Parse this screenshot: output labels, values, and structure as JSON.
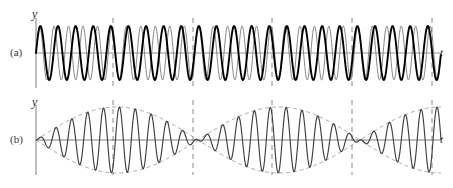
{
  "figure": {
    "width": 453,
    "height": 188,
    "background": "#ffffff"
  },
  "panels": [
    {
      "id": "a",
      "tag": "(a)",
      "y_axis_label": "y",
      "t_axis_label": "t",
      "axis_y_px": 53,
      "axis_x_px": 36,
      "description": "two superimposed sinusoids of slightly different frequency"
    },
    {
      "id": "b",
      "tag": "(b)",
      "y_axis_label": "y",
      "t_axis_label": "t",
      "axis_y_px": 140,
      "axis_x_px": 36,
      "description": "sum of the two sinusoids showing beats with dashed envelope"
    }
  ],
  "colors": {
    "wave_thick": "#000000",
    "wave_thin": "#7a7a7a",
    "sum_wave": "#444444",
    "envelope": "#9a9a9a",
    "axis": "#8a8a8a",
    "node_line": "#8a8a8a",
    "text": "#2b2b2b"
  },
  "chart_data": {
    "type": "line",
    "title": "",
    "xlabel": "t",
    "ylabel": "y",
    "grid": false,
    "legend": "none",
    "xlim": [
      0,
      453
    ],
    "panel_a": {
      "xlabel": "t",
      "ylabel": "y",
      "ylim": [
        -1,
        1
      ],
      "series": [
        {
          "name": "wave-1",
          "style": "thick-black",
          "amplitude": 1,
          "cycles_across_axis": 23,
          "phase_deg": 0
        },
        {
          "name": "wave-2",
          "style": "thin-gray",
          "amplitude": 1,
          "cycles_across_axis": 28,
          "phase_deg": 0
        }
      ]
    },
    "panel_b": {
      "xlabel": "t",
      "ylabel": "y",
      "ylim": [
        -2,
        2
      ],
      "series": [
        {
          "name": "beat-sum",
          "style": "solid-dark",
          "carrier_cycles_across_axis": 25.5,
          "envelope_cycles_across_axis": 2.5,
          "amplitude": 2
        },
        {
          "name": "envelope-upper",
          "style": "dashed-gray",
          "amplitude": 2
        },
        {
          "name": "envelope-lower",
          "style": "dashed-gray",
          "amplitude": -2
        }
      ],
      "node_positions_px": [
        113,
        193,
        272,
        352,
        432
      ]
    },
    "node_marker_lines_px": [
      113,
      193,
      272,
      352,
      432
    ]
  }
}
